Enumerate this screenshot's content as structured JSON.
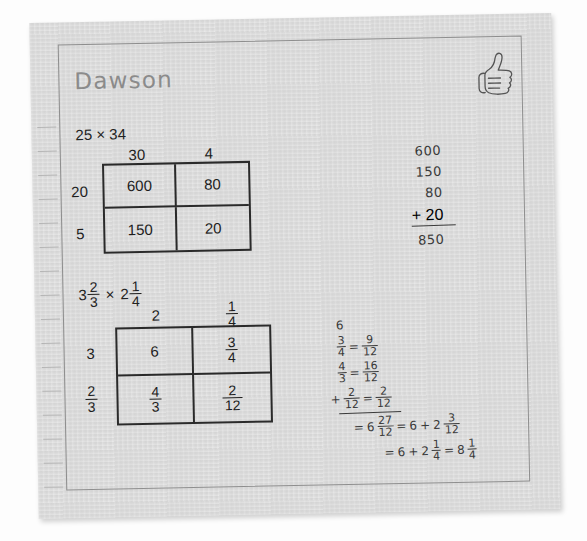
{
  "worksheet": {
    "student_name": "Dawson",
    "stamp_icon": "thumbs-up-icon"
  },
  "problem_1": {
    "title": "25 × 34",
    "column_headers": [
      "30",
      "4"
    ],
    "row_headers": [
      "20",
      "5"
    ],
    "cells": [
      [
        "600",
        "80"
      ],
      [
        "150",
        "20"
      ]
    ],
    "work": {
      "addends": [
        "600",
        "150",
        "80"
      ],
      "last_addend": "+ 20",
      "sum": "850"
    }
  },
  "problem_2": {
    "title_whole_1": "3",
    "title_frac_1_num": "2",
    "title_frac_1_den": "3",
    "title_operator": "×",
    "title_whole_2": "2",
    "title_frac_2_num": "1",
    "title_frac_2_den": "4",
    "col_header_1": "2",
    "col_header_2_num": "1",
    "col_header_2_den": "4",
    "row_header_1": "3",
    "row_header_2_num": "2",
    "row_header_2_den": "3",
    "cell_r1c1": "6",
    "cell_r1c2_num": "3",
    "cell_r1c2_den": "4",
    "cell_r2c1_num": "4",
    "cell_r2c1_den": "3",
    "cell_r2c2_num": "2",
    "cell_r2c2_den": "12",
    "work": {
      "whole": "6",
      "conv_1": {
        "left_num": "3",
        "left_den": "4",
        "eq": "=",
        "right_num": "9",
        "right_den": "12"
      },
      "conv_2": {
        "left_num": "4",
        "left_den": "3",
        "eq": "=",
        "right_num": "16",
        "right_den": "12"
      },
      "conv_3": {
        "plus": "+",
        "left_num": "2",
        "left_den": "12",
        "eq": "=",
        "right_num": "2",
        "right_den": "12"
      },
      "result_1": {
        "eq": "=",
        "whole": "6",
        "num": "27",
        "den": "12",
        "eq2": "=",
        "whole2": "6",
        "plus": "+",
        "whole3": "2",
        "num2": "3",
        "den2": "12"
      },
      "result_2": {
        "eq": "=",
        "whole": "6",
        "plus": "+",
        "whole2": "2",
        "num": "1",
        "den": "4",
        "eq2": "=",
        "final_whole": "8",
        "final_num": "1",
        "final_den": "4"
      }
    }
  }
}
